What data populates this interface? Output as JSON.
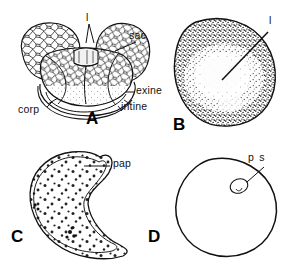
{
  "figure": {
    "panels": [
      {
        "id": "A",
        "letter": "A",
        "name": "bisaccate-pollen-grain",
        "description": "Bisaccate (two-sacced) pollen grain with reticulate sacs, corpus, exine and intine layers",
        "labels": [
          {
            "key": "l",
            "text": "l"
          },
          {
            "key": "sac",
            "text": "sac"
          },
          {
            "key": "exine",
            "text": "exine"
          },
          {
            "key": "intine",
            "text": "intine"
          },
          {
            "key": "corp",
            "text": "corp"
          }
        ]
      },
      {
        "id": "B",
        "letter": "B",
        "name": "stippled-pollen-grain",
        "description": "Rounded pollen grain with dense stippled exine and a pale central body, leader to leptoma",
        "labels": [
          {
            "key": "l",
            "text": "l"
          }
        ]
      },
      {
        "id": "C",
        "letter": "C",
        "name": "papillate-pollen-grain",
        "description": "Teardrop shaped grain with a papilla at the apex and coarse granular contents",
        "labels": [
          {
            "key": "pap",
            "text": "pap"
          }
        ]
      },
      {
        "id": "D",
        "letter": "D",
        "name": "spherical-pollen-grain",
        "description": "Plain spherical grain outline with a small pore structure",
        "labels": [
          {
            "key": "ps",
            "text": "p s"
          }
        ]
      }
    ],
    "colors": {
      "ink": "#111111",
      "background": "#ffffff",
      "stipple": "#1a1a1a",
      "pale_fill": "#fbfbfb"
    }
  }
}
